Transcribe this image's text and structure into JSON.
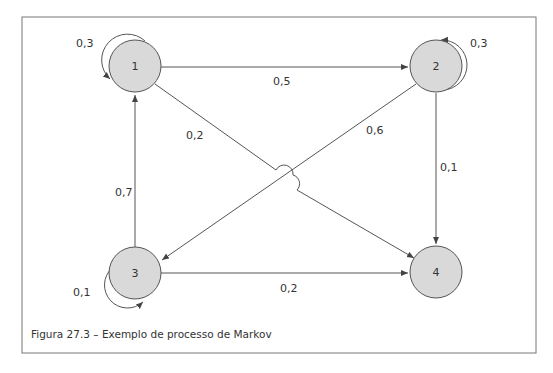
{
  "figure": {
    "caption": "Figura 27.3 – Exemplo de processo de Markov",
    "colors": {
      "node_fill": "#d9d9d9",
      "stroke": "#555555",
      "frame": "#777777",
      "text": "#333333"
    }
  },
  "nodes": [
    {
      "id": "1",
      "label": "1"
    },
    {
      "id": "2",
      "label": "2"
    },
    {
      "id": "3",
      "label": "3"
    },
    {
      "id": "4",
      "label": "4"
    }
  ],
  "edges": [
    {
      "from": "1",
      "to": "1",
      "label": "0,3"
    },
    {
      "from": "1",
      "to": "2",
      "label": "0,5"
    },
    {
      "from": "1",
      "to": "4",
      "label": "0,2"
    },
    {
      "from": "2",
      "to": "2",
      "label": "0,3"
    },
    {
      "from": "2",
      "to": "3",
      "label": "0,6"
    },
    {
      "from": "2",
      "to": "4",
      "label": "0,1"
    },
    {
      "from": "3",
      "to": "1",
      "label": "0,7"
    },
    {
      "from": "3",
      "to": "3",
      "label": "0,1"
    },
    {
      "from": "3",
      "to": "4",
      "label": "0,2"
    }
  ]
}
